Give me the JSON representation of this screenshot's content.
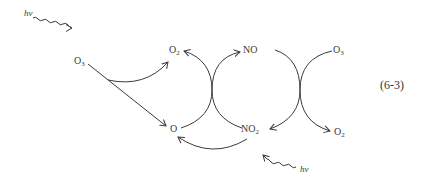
{
  "diagram": {
    "equation_number": "(6-3)",
    "nodes": {
      "hv_top": {
        "text": "hv"
      },
      "o3_left": {
        "base": "O",
        "sub": "3"
      },
      "o2_top": {
        "base": "O",
        "sub": "2"
      },
      "no": {
        "base": "NO",
        "sub": ""
      },
      "o3_right": {
        "base": "O",
        "sub": "3"
      },
      "o_atom": {
        "base": "O",
        "sub": ""
      },
      "no2": {
        "base": "NO",
        "sub": "2"
      },
      "o2_right": {
        "base": "O",
        "sub": "2"
      },
      "hv_bottom": {
        "text": "hv"
      }
    },
    "edges": [
      {
        "from": "hv_top",
        "to": "o3_left",
        "style": "wavy"
      },
      {
        "from": "o3_left",
        "to": "o2_top",
        "style": "curved"
      },
      {
        "from": "o3_left",
        "to": "o_atom",
        "style": "straight"
      },
      {
        "from": "o_atom",
        "to": "o2_top",
        "style": "curved-crossing"
      },
      {
        "from": "no2",
        "to": "no",
        "style": "curved-crossing"
      },
      {
        "from": "no",
        "to": "no2",
        "style": "curved-crossing"
      },
      {
        "from": "o3_right",
        "to": "o2_right",
        "style": "curved-crossing"
      },
      {
        "from": "no2",
        "to": "o_atom",
        "style": "curved"
      },
      {
        "from": "hv_bottom",
        "to": "no2",
        "style": "wavy"
      }
    ]
  }
}
